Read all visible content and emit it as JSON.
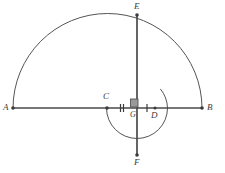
{
  "figure": {
    "canvas": {
      "width": 225,
      "height": 173
    },
    "background_color": "#ffffff",
    "stroke_color": "#555555",
    "label_color": "#3c3c3c",
    "right_angle_fill": "#9a9a9a",
    "point_fill": "#3c3c3c"
  },
  "points": [
    {
      "id": "A",
      "label": "A",
      "x": 13,
      "y": 108,
      "label_dx": -9,
      "label_dy": -4,
      "dot": true
    },
    {
      "id": "B",
      "label": "B",
      "x": 202,
      "y": 108,
      "label_dx": 5,
      "label_dy": -4,
      "dot": true
    },
    {
      "id": "C",
      "label": "C",
      "x": 107,
      "y": 108,
      "label_dx": -3,
      "label_dy": -14,
      "dot": true
    },
    {
      "id": "D",
      "label": "D",
      "x": 155,
      "y": 108,
      "label_dx": -3,
      "label_dy": 4,
      "dot": true
    },
    {
      "id": "E",
      "label": "E",
      "x": 137,
      "y": 15,
      "label_dx": -2,
      "label_dy": -13,
      "dot": true
    },
    {
      "id": "F",
      "label": "F",
      "x": 137,
      "y": 155,
      "label_dx": -2,
      "label_dy": 3,
      "dot": true
    },
    {
      "id": "G",
      "label": "G",
      "x": 137,
      "y": 108,
      "label_dx": -6,
      "label_dy": 4,
      "dot": false
    }
  ],
  "segments": [
    {
      "id": "AB",
      "from": "A",
      "to": "B",
      "x1": 13,
      "y1": 108,
      "x2": 202,
      "y2": 108,
      "width": 1.6
    },
    {
      "id": "EF",
      "from": "E",
      "to": "F",
      "x1": 137,
      "y1": 15,
      "x2": 137,
      "y2": 155,
      "width": 1.6
    }
  ],
  "arcs": [
    {
      "id": "large-semicircle",
      "description": "Semicircle on diameter AB bulging upward, passing through E",
      "cx": 107.5,
      "cy": 108,
      "r": 94.5,
      "start_angle_deg": 180,
      "end_angle_deg": 360,
      "path": "M 13 108 A 94.5 94.5 0 0 1 202 108",
      "width": 1.0
    },
    {
      "id": "small-circle",
      "description": "Circle centered at G through C and F, tangent-ish region below AB",
      "cx": 137,
      "cy": 108,
      "r": 30.5,
      "path": "M 106.5 108 A 30.5 30.5 0 0 0 167.5 108",
      "extra_path": "M 167.5 108 A 30.5 30.5 0 0 0 158.8 86.5",
      "width": 1.0
    }
  ],
  "tick_marks": [
    {
      "id": "tick-CG",
      "on_segment": "CG",
      "count": 2,
      "x": 122,
      "y": 108,
      "spacing": 3,
      "half_height": 4
    },
    {
      "id": "tick-GD",
      "on_segment": "GD",
      "count": 1,
      "x": 147,
      "y": 108,
      "spacing": 0,
      "half_height": 4
    }
  ],
  "right_angle": {
    "id": "right-angle-at-G",
    "vertex": "G",
    "x": 131,
    "y": 99,
    "size": 8,
    "filled": true,
    "quadrant": "upper-left"
  },
  "labels": {
    "A": "A",
    "B": "B",
    "C": "C",
    "D": "D",
    "E": "E",
    "F": "F",
    "G": "G"
  }
}
